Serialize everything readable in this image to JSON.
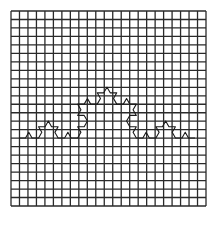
{
  "figure": {
    "background": "#ffffff",
    "grid": {
      "x0": 11,
      "y0": 11,
      "x1": 206,
      "y1": 206,
      "cols": 23,
      "rows": 23,
      "line_color": "#2a2a2a",
      "line_width": 1.3
    },
    "curve": {
      "type": "koch",
      "iterations": 3,
      "start": [
        19,
        138
      ],
      "end": [
        195,
        138
      ],
      "bump_direction": "up",
      "color": "#1a1a1a",
      "line_width": 1.1
    }
  }
}
